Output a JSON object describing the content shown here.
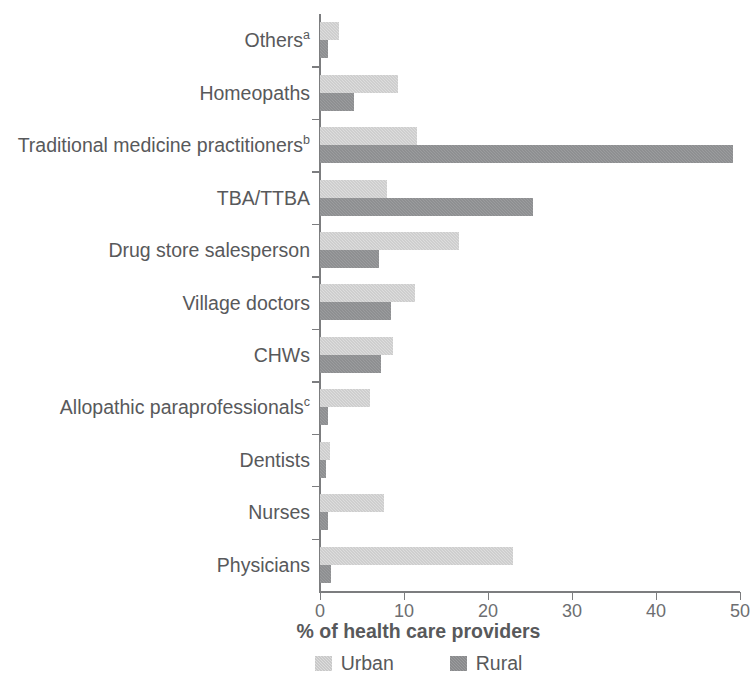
{
  "chart_data": {
    "type": "bar",
    "orientation": "horizontal",
    "title": "",
    "xlabel": "% of health care providers",
    "ylabel": "",
    "xlim": [
      0,
      50
    ],
    "xticks": [
      0,
      10,
      20,
      30,
      40,
      50
    ],
    "xtick_labels": [
      "0",
      "10",
      "20",
      "30",
      "40",
      "50"
    ],
    "grid": false,
    "legend_position": "bottom",
    "categories": [
      "Others",
      "Homeopaths",
      "Traditional medicine practitioners",
      "TBA/TTBA",
      "Drug store salesperson",
      "Village doctors",
      "CHWs",
      "Allopathic paraprofessionals",
      "Dentists",
      "Nurses",
      "Physicians"
    ],
    "category_superscripts": [
      "a",
      "",
      "b",
      "",
      "",
      "",
      "",
      "c",
      "",
      "",
      ""
    ],
    "series": [
      {
        "name": "Urban",
        "color": "#dddddd",
        "values": [
          2.3,
          9.3,
          11.5,
          8.0,
          16.5,
          11.3,
          8.7,
          6.0,
          1.2,
          7.6,
          23.0
        ]
      },
      {
        "name": "Rural",
        "color": "#9b9c9e",
        "values": [
          1.0,
          4.0,
          49.2,
          25.4,
          7.0,
          8.5,
          7.3,
          1.0,
          0.7,
          0.9,
          1.3
        ]
      }
    ]
  },
  "legend": {
    "items": [
      {
        "label": "Urban",
        "color": "#dddddd"
      },
      {
        "label": "Rural",
        "color": "#9b9c9e"
      }
    ]
  }
}
